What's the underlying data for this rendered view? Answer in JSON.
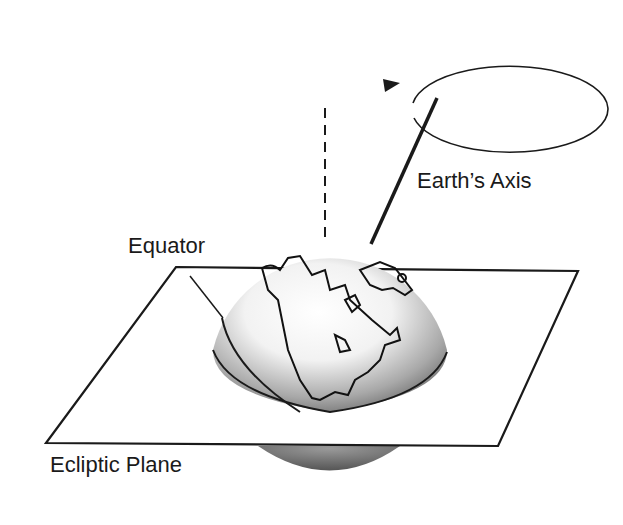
{
  "diagram": {
    "labels": {
      "axis": "Earth’s Axis",
      "equator": "Equator",
      "plane": "Ecliptic Plane"
    },
    "elements": [
      "precession-ellipse",
      "vertical-dashed-axis",
      "earth-axis-line",
      "earth-globe",
      "ecliptic-plane",
      "equator-line"
    ],
    "colors": {
      "ink": "#1a1a1a",
      "globe_light": "#ffffff",
      "globe_dark": "#7a7a7a"
    }
  }
}
